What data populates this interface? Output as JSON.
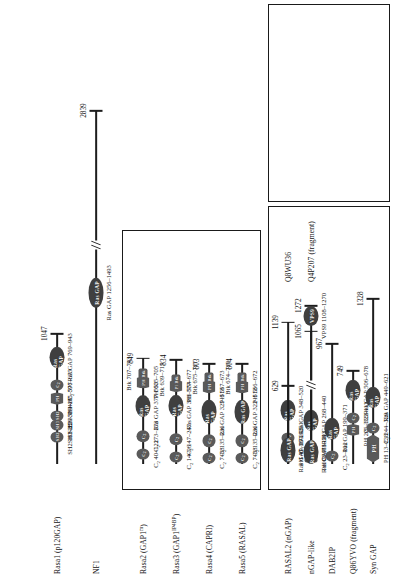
{
  "figure": {
    "orientation": "rotated-90",
    "colors": {
      "domain_fill": "#5a5a5a",
      "domain_fill_dark": "#3f3f3f",
      "line": "#1d1d1d",
      "box_border": "#1a1a1a",
      "domain_text": "#f2f2f2"
    }
  },
  "groups": [
    {
      "id": "group-mammalian-gaps",
      "label": ""
    },
    {
      "id": "group-nongap-related",
      "label": ""
    },
    {
      "id": "group-fungal",
      "label": ""
    }
  ],
  "domain_legend": [
    {
      "name": "SH2",
      "shape": "oval"
    },
    {
      "name": "SH3",
      "shape": "oval"
    },
    {
      "name": "PH",
      "shape": "hex"
    },
    {
      "name": "Btk",
      "shape": "rect"
    },
    {
      "name": "C2",
      "shape": "oval"
    },
    {
      "name": "Ras GAP",
      "shape": "oval"
    },
    {
      "name": "VPS9",
      "shape": "oval"
    }
  ],
  "proteins": [
    {
      "id": "rasa1",
      "name": "Rasa1 (p120GAP)",
      "length": 1047,
      "length_label": "1047",
      "group": 0,
      "domains": [
        {
          "label": "SH2",
          "kind": "oval",
          "start": 181,
          "end": 256,
          "coord": "SH2 181–256"
        },
        {
          "label": "SH3",
          "kind": "oval",
          "start": 283,
          "end": 339,
          "coord": "SH3 283–339"
        },
        {
          "label": "SH2",
          "kind": "oval",
          "start": 351,
          "end": 426,
          "coord": "SH2 351–426"
        },
        {
          "label": "PH",
          "kind": "hex",
          "start": 475,
          "end": 577,
          "coord": "PH 475–577"
        },
        {
          "label": "C2",
          "kind": "oval",
          "start": 596,
          "end": 675,
          "coord": "C₂ 596–675"
        },
        {
          "label": "Ras GAP",
          "kind": "oval",
          "start": 769,
          "end": 943,
          "coord": "Ras GAP 769–943"
        }
      ]
    },
    {
      "id": "nf1",
      "name": "NF1",
      "length": 2839,
      "length_label": "2839",
      "group": 0,
      "has_break": true,
      "domains": [
        {
          "label": "Ras GAP",
          "kind": "oval",
          "start": 1256,
          "end": 1493,
          "coord": "Ras GAP 1256–1493"
        }
      ]
    },
    {
      "id": "rasa2",
      "name": "Rasa2 (GAP1m)",
      "name_sup": "m",
      "length": 849,
      "length_label": "849",
      "group": 1,
      "domains": [
        {
          "label": "C2",
          "kind": "oval",
          "start": 40,
          "end": 122,
          "coord": "C₂ 40–122"
        },
        {
          "label": "C2",
          "kind": "oval",
          "start": 173,
          "end": 273,
          "coord": "C₂ 173–273"
        },
        {
          "label": "Ras GAP",
          "kind": "oval",
          "start": 377,
          "end": 553,
          "coord": "Ras GAP 377–553"
        },
        {
          "label": "PH",
          "kind": "hex",
          "start": 605,
          "end": 705,
          "coord": "PH 605–705"
        },
        {
          "label": "Btk",
          "kind": "rect",
          "start": 707,
          "end": 743,
          "coord": "Btk 707–743"
        }
      ]
    },
    {
      "id": "rasa3",
      "name": "Rasa3 (GAP1IP4BP)",
      "length": 834,
      "length_label": "834",
      "group": 1,
      "domains": [
        {
          "label": "C2",
          "kind": "oval",
          "start": 14,
          "end": 96,
          "coord": "C₂ 14–96"
        },
        {
          "label": "C2",
          "kind": "oval",
          "start": 147,
          "end": 247,
          "coord": "C₂ 147–247"
        },
        {
          "label": "Ras GAP",
          "kind": "oval",
          "start": 381,
          "end": 554,
          "coord": "Ras GAP 381–554"
        },
        {
          "label": "PH",
          "kind": "hex",
          "start": 577,
          "end": 677,
          "coord": "PH 577–677"
        },
        {
          "label": "Btk",
          "kind": "rect",
          "start": 639,
          "end": 715,
          "coord": "Btk 639–715"
        }
      ]
    },
    {
      "id": "rasa4",
      "name": "Rasa4 (CAPRI)",
      "length": 803,
      "length_label": "803",
      "group": 1,
      "domains": [
        {
          "label": "C2",
          "kind": "oval",
          "start": 7,
          "end": 88,
          "coord": "C₂ 7–88"
        },
        {
          "label": "C2",
          "kind": "oval",
          "start": 135,
          "end": 236,
          "coord": "C₂ 135–236"
        },
        {
          "label": "Ras GAP",
          "kind": "oval",
          "start": 325,
          "end": 513,
          "coord": "Ras GAP 325–513"
        },
        {
          "label": "PH",
          "kind": "hex",
          "start": 567,
          "end": 673,
          "coord": "PH 567–673"
        },
        {
          "label": "Btk",
          "kind": "rect",
          "start": 675,
          "end": 711,
          "coord": "Btk 675–711"
        }
      ]
    },
    {
      "id": "rasa5",
      "name": "Rasa5 (RASAL)",
      "length": 804,
      "length_label": "804",
      "group": 1,
      "domains": [
        {
          "label": "C2",
          "kind": "oval",
          "start": 7,
          "end": 88,
          "coord": "C₂ 7–88"
        },
        {
          "label": "C2",
          "kind": "oval",
          "start": 135,
          "end": 236,
          "coord": "C₂ 135–236"
        },
        {
          "label": "Ras GAP",
          "kind": "oval",
          "start": 322,
          "end": 512,
          "coord": "Ras GAP 322–512"
        },
        {
          "label": "PH",
          "kind": "hex",
          "start": 566,
          "end": 672,
          "coord": "PH 566–672"
        },
        {
          "label": "Btk",
          "kind": "rect",
          "start": 674,
          "end": 710,
          "coord": "Btk 674–710"
        }
      ]
    },
    {
      "id": "rasal2",
      "name": "RASAL2 (nGAP)",
      "length": 1139,
      "length_label": "1139",
      "group": 2,
      "domains": [
        {
          "label": "PH",
          "kind": "hex",
          "start": 45,
          "end": 160,
          "coord": "PH 45–160"
        },
        {
          "label": "C2",
          "kind": "oval",
          "start": 171,
          "end": 251,
          "coord": "C₂ 171–251"
        },
        {
          "label": "Ras GAP",
          "kind": "oval",
          "start": 348,
          "end": 520,
          "coord": "Ras GAP 348–520"
        }
      ]
    },
    {
      "id": "ngap-like",
      "name": "nGAP-like",
      "length": 1065,
      "length_label": "1065",
      "group": 2,
      "domains": [
        {
          "label": "PH",
          "kind": "rect",
          "start": 29,
          "end": 78,
          "coord": "PH 29–78"
        },
        {
          "label": "C2",
          "kind": "oval",
          "start": 91,
          "end": 171,
          "coord": "C₂ 91–171"
        },
        {
          "label": "Ras GAP",
          "kind": "oval",
          "start": 268,
          "end": 440,
          "coord": "Ras GAP 268–440"
        }
      ]
    },
    {
      "id": "dab2ip",
      "name": "DAB2IP",
      "length": 967,
      "length_label": "967",
      "group": 2,
      "domains": [
        {
          "label": "C2",
          "kind": "oval",
          "start": 23,
          "end": 102,
          "coord": "C₂ 23–102"
        },
        {
          "label": "Ras GAP",
          "kind": "oval",
          "start": 199,
          "end": 371,
          "coord": "Ras GAP 199–371"
        }
      ]
    },
    {
      "id": "q86yv0",
      "name": "Q86YVO (fragment)",
      "length": 749,
      "length_label": "749",
      "group": 2,
      "domains": [
        {
          "label": "PH",
          "kind": "hex",
          "start": 226,
          "end": 322,
          "coord": "PH 226–322"
        },
        {
          "label": "C2",
          "kind": "oval",
          "start": 333,
          "end": 411,
          "coord": "C₂ 333–411"
        },
        {
          "label": "Ras GAP",
          "kind": "oval",
          "start": 506,
          "end": 678,
          "coord": "Ras GAP 506–678"
        }
      ]
    },
    {
      "id": "syn-gap",
      "name": "Syn GAP",
      "length": 1328,
      "length_label": "1328",
      "group": 2,
      "domains": [
        {
          "label": "PH",
          "kind": "hex",
          "start": 13,
          "end": 238,
          "coord": "PH 13–238"
        },
        {
          "label": "C2",
          "kind": "oval",
          "start": 244,
          "end": 329,
          "coord": "C₂ 244–329"
        },
        {
          "label": "Ras GAP",
          "kind": "oval",
          "start": 449,
          "end": 621,
          "coord": "Ras GAP 449–621"
        }
      ]
    },
    {
      "id": "q8wu36",
      "name": "Q8WU36",
      "length": 629,
      "length_label": "629",
      "group": 3,
      "domains": [
        {
          "label": "Ras GAP",
          "kind": "oval",
          "start": 11,
          "end": 215,
          "coord": "Ras GAP 11–215"
        }
      ]
    },
    {
      "id": "q4p207",
      "name": "Q4P207 (fragment)",
      "length": 1272,
      "length_label": "1272",
      "group": 3,
      "has_break": true,
      "domains": [
        {
          "label": "Ras GAP",
          "kind": "oval",
          "start": 1,
          "end": 193,
          "coord": "Ras GAP 1–193"
        },
        {
          "label": "VPS9",
          "kind": "oval",
          "start": 1108,
          "end": 1270,
          "coord": "VPS9 1108–1270"
        }
      ]
    }
  ]
}
